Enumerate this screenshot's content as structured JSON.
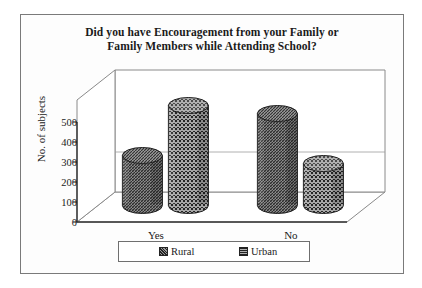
{
  "figure": {
    "title_line1": "Did you have Encouragement from your Family or",
    "title_line2": "Family Members while Attending School?"
  },
  "chart_data": {
    "type": "bar",
    "title": "Did you have Encouragement from your Family or Family Members while Attending School?",
    "xlabel": "",
    "ylabel": "No. of subjects",
    "categories": [
      "Yes",
      "No"
    ],
    "series": [
      {
        "name": "Rural",
        "values": [
          250,
          460
        ]
      },
      {
        "name": "Urban",
        "values": [
          500,
          210
        ]
      }
    ],
    "yticks": [
      0,
      100,
      200,
      300,
      400,
      500
    ],
    "ylim": [
      0,
      500
    ],
    "grid": false,
    "legend_position": "bottom",
    "projection": "3d-cylinder",
    "colors": {
      "rural": "#5d5d5d",
      "urban": "#7e7e7e",
      "axis": "#3a3a3a",
      "frame": "#7a7a7a"
    }
  },
  "legend": {
    "items": [
      {
        "label": "Rural"
      },
      {
        "label": "Urban"
      }
    ]
  }
}
